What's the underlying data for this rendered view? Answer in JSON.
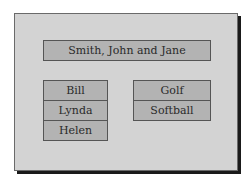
{
  "header": {
    "label": "Smith, John and Jane"
  },
  "children": {
    "items": [
      {
        "label": "Bill"
      },
      {
        "label": "Lynda"
      },
      {
        "label": "Helen"
      }
    ]
  },
  "activities": {
    "items": [
      {
        "label": "Golf"
      },
      {
        "label": "Softball"
      }
    ]
  },
  "colors": {
    "background": "#ffffff",
    "panel": "#d3d3d3",
    "box": "#b3b3b3",
    "border": "#555555",
    "shadow": "#1a1a1a"
  }
}
